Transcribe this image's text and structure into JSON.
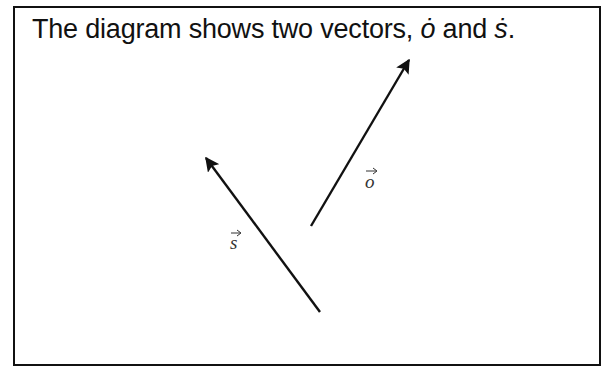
{
  "caption": {
    "prefix": "The diagram shows two vectors, ",
    "vector_o": "ȯ",
    "middle": " and ",
    "vector_s": "ṡ",
    "suffix": "."
  },
  "vectors": [
    {
      "name": "o",
      "label": "o",
      "from": [
        311,
        226
      ],
      "to": [
        410,
        58
      ]
    },
    {
      "name": "s",
      "label": "s",
      "from": [
        320,
        312
      ],
      "to": [
        204,
        155
      ]
    }
  ],
  "colors": {
    "line": "#111111",
    "label": "#333333",
    "border": "#111111"
  }
}
